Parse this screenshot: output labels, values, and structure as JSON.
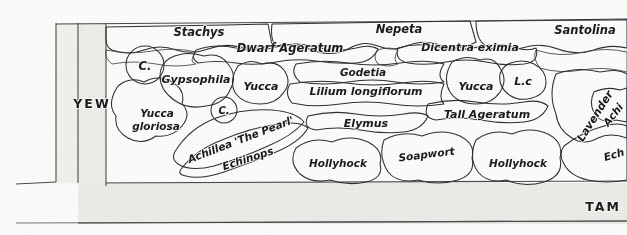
{
  "document": {
    "kind": "hand-drawn garden planting plan",
    "orientation": "horizontal border strip"
  },
  "structure": {
    "hedge_label": "YEW",
    "path_label": "TAM",
    "bed_background_color": "#ffffff",
    "path_color": "#e9e8e3",
    "hedge_color": "#eceae5",
    "ink_color": "#2b2c30"
  },
  "tones": {
    "white": "#ffffff",
    "very_light": "#f1f0ec",
    "light": "#e2e0da",
    "mid_light": "#d2cfc8",
    "mid": "#bdbab2",
    "mid_dark": "#a9a69e",
    "dark": "#8f8c84",
    "darkest": "#74716a"
  },
  "plants": [
    {
      "id": "stachys",
      "label": "Stachys",
      "row": "back",
      "tone": "light"
    },
    {
      "id": "nepeta",
      "label": "Nepeta",
      "row": "back",
      "tone": "mid_light"
    },
    {
      "id": "santolina",
      "label": "Santolina",
      "row": "back",
      "tone": "light"
    },
    {
      "id": "dwarf-ageratum",
      "label": "Dwarf Ageratum",
      "row": "back",
      "tone": "very_light"
    },
    {
      "id": "dicentra",
      "label": "Dicentra eximia",
      "row": "back",
      "tone": "very_light"
    },
    {
      "id": "c-1",
      "label": "C.",
      "row": "mid",
      "tone": "dark"
    },
    {
      "id": "c-2",
      "label": "C.",
      "row": "mid",
      "tone": "dark"
    },
    {
      "id": "gypsophila",
      "label": "Gypsophila",
      "row": "mid",
      "tone": "white"
    },
    {
      "id": "yucca-1",
      "label": "Yucca",
      "row": "mid",
      "tone": "very_light"
    },
    {
      "id": "godetia",
      "label": "Godetia",
      "row": "mid",
      "tone": "mid_light"
    },
    {
      "id": "lilium",
      "label": "Lilium longiflorum",
      "row": "mid",
      "tone": "white"
    },
    {
      "id": "yucca-2",
      "label": "Yucca",
      "row": "mid",
      "tone": "white"
    },
    {
      "id": "lc",
      "label": "L.c",
      "row": "mid",
      "tone": "white"
    },
    {
      "id": "yucca-gloriosa",
      "label": "Yucca gloriosa",
      "row": "mid",
      "tone": "very_light"
    },
    {
      "id": "lavender",
      "label": "Lavender",
      "row": "mid",
      "tone": "mid"
    },
    {
      "id": "achillea",
      "label": "Achillea 'The Pearl'",
      "row": "front",
      "tone": "white"
    },
    {
      "id": "echinops",
      "label": "Echinops",
      "row": "front",
      "tone": "dark"
    },
    {
      "id": "elymus",
      "label": "Elymus",
      "row": "front",
      "tone": "very_light"
    },
    {
      "id": "tall-ageratum",
      "label": "Tall Ageratum",
      "row": "front",
      "tone": "very_light"
    },
    {
      "id": "hollyhock-1",
      "label": "Hollyhock",
      "row": "front",
      "tone": "mid_light"
    },
    {
      "id": "soapwort",
      "label": "Soapwort",
      "row": "front",
      "tone": "mid_light"
    },
    {
      "id": "hollyhock-2",
      "label": "Hollyhock",
      "row": "front",
      "tone": "mid_light"
    },
    {
      "id": "achillea-edge",
      "label": "Achi",
      "row": "front",
      "tone": "white"
    },
    {
      "id": "echinops-edge",
      "label": "Ech",
      "row": "front",
      "tone": "mid"
    }
  ]
}
